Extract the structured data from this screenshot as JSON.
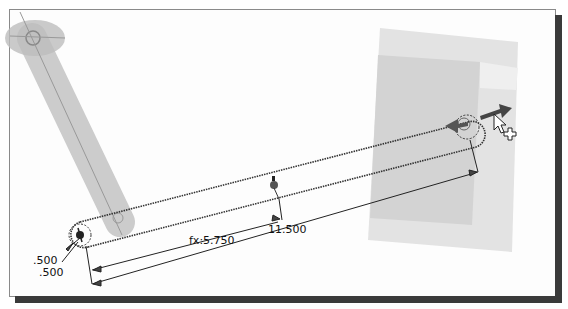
{
  "viewport": {
    "description": "CAD sketch viewport — slot/link sketch with dimensions"
  },
  "dimensions": {
    "radius_1": ".500",
    "radius_2": ".500",
    "half_length": "fx:5.750",
    "length": "11.500"
  },
  "colors": {
    "background": "#fdfdfd",
    "frame_border": "#8a8a8a",
    "shadow": "#3a3a3a",
    "ghost_link": "#c8c8c8",
    "block_light": "#dcdcdc",
    "block_dark": "#cfcfcf",
    "sketch_line": "#333333",
    "arrow": "#555555"
  },
  "cursor": {
    "icon": "move-cursor-with-plus"
  }
}
